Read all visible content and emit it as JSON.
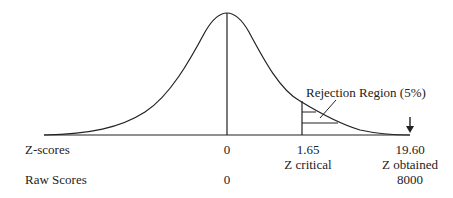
{
  "diagram": {
    "type": "normal-distribution-hypothesis-test",
    "colors": {
      "line": "#222222",
      "text": "#222222",
      "background": "#ffffff"
    },
    "annotation": "Rejection Region (5%)",
    "rows": {
      "z_scores": {
        "label": "Z-scores",
        "mean": "0",
        "critical": "1.65",
        "obtained": "19.60"
      },
      "descriptors": {
        "critical": "Z critical",
        "obtained": "Z obtained"
      },
      "raw_scores": {
        "label": "Raw Scores",
        "mean": "0",
        "obtained": "8000"
      }
    },
    "marker": "down-arrow-icon"
  }
}
